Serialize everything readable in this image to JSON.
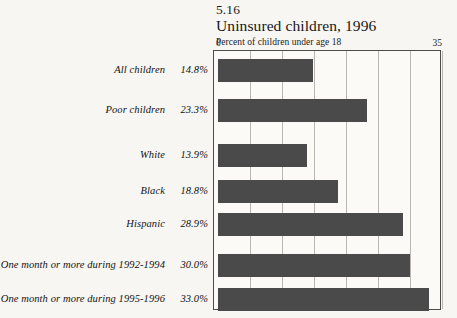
{
  "figure": {
    "number": "5.16",
    "title": "Uninsured children, 1996",
    "subtitle": "Percent of children under age 18"
  },
  "axis": {
    "min_label": "0",
    "max_label": "35"
  },
  "chart_data": {
    "type": "bar",
    "orientation": "horizontal",
    "title": "Uninsured children, 1996",
    "subtitle": "Percent of children under age 18",
    "figure_number": "5.16",
    "xlabel": "Percent of children under age 18",
    "ylabel": "",
    "xlim": [
      0,
      35
    ],
    "xticks": [
      0,
      5,
      10,
      15,
      20,
      25,
      30,
      35
    ],
    "xtick_labels_shown": [
      "0",
      "35"
    ],
    "grid": true,
    "grid_axis": "x",
    "legend": false,
    "bar_color": "#4a4a4a",
    "categories": [
      "All children",
      "Poor children",
      "White",
      "Black",
      "Hispanic",
      "One month or more during 1992-1994",
      "One month or more during 1995-1996"
    ],
    "values": [
      14.8,
      23.3,
      13.9,
      18.8,
      28.9,
      30.0,
      33.0
    ],
    "value_labels": [
      "14.8%",
      "23.3%",
      "13.9%",
      "18.8%",
      "28.9%",
      "30.0%",
      "33.0%"
    ]
  }
}
